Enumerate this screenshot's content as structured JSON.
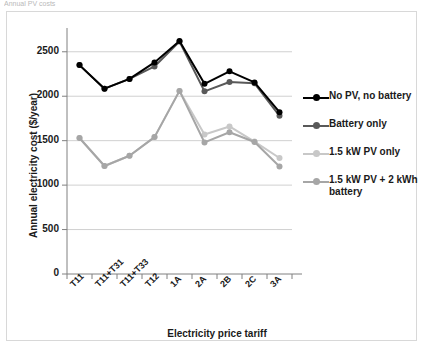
{
  "caption_fragment": "Annual PV costs",
  "chart_data": {
    "type": "line",
    "title": "",
    "xlabel": "Electricity price tariff",
    "ylabel": "Annual electricity cost ($/year)",
    "categories": [
      "T11",
      "T11+T31",
      "T11+T33",
      "T12",
      "1A",
      "2A",
      "2B",
      "2C",
      "3A"
    ],
    "ylim": [
      0,
      2700
    ],
    "yticks": [
      0,
      500,
      1000,
      1500,
      2000,
      2500
    ],
    "ytick_labels": [
      "0",
      "500",
      "1000",
      "1500",
      "2000",
      "2500"
    ],
    "grid": "horizontal",
    "legend_position": "right",
    "series": [
      {
        "name": "No PV, no battery",
        "color": "#000000",
        "values": [
          2350,
          2085,
          2195,
          2380,
          2620,
          2140,
          2280,
          2155,
          1820
        ]
      },
      {
        "name": "Battery only",
        "color": "#595959",
        "values": [
          2350,
          2085,
          2195,
          2335,
          2615,
          2055,
          2160,
          2145,
          1780
        ]
      },
      {
        "name": "1.5 kW PV only",
        "color": "#c8c8c8",
        "values": [
          1530,
          1215,
          1330,
          1540,
          2060,
          1570,
          1660,
          1490,
          1305
        ]
      },
      {
        "name": "1.5 kW PV + 2 kWh battery",
        "color": "#a6a6a6",
        "values": [
          1530,
          1215,
          1330,
          1540,
          2060,
          1480,
          1595,
          1485,
          1210
        ]
      }
    ]
  },
  "legend": {
    "items": [
      {
        "label": "No PV, no battery",
        "color": "#000000"
      },
      {
        "label": "Battery only",
        "color": "#595959"
      },
      {
        "label": "1.5 kW PV only",
        "color": "#c8c8c8"
      },
      {
        "label": "1.5 kW PV + 2 kWh battery",
        "color": "#a6a6a6"
      }
    ]
  }
}
